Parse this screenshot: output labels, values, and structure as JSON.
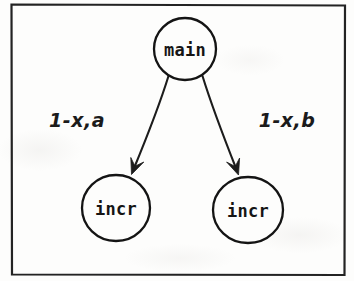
{
  "figure": {
    "type": "node-edge-diagram",
    "frame": {
      "present": true,
      "stroke_color": "#222222"
    },
    "background_color": "#fdfdfc",
    "ink_color": "#151515"
  },
  "nodes": [
    {
      "id": "main",
      "label": "main",
      "role": "root",
      "cx": 185,
      "cy": 49,
      "rx": 31,
      "ry": 31
    },
    {
      "id": "incr-left",
      "label": "incr",
      "role": "leaf",
      "cx": 116,
      "cy": 208,
      "rx": 34,
      "ry": 33
    },
    {
      "id": "incr-right",
      "label": "incr",
      "role": "leaf",
      "cx": 248,
      "cy": 210,
      "rx": 35,
      "ry": 33
    }
  ],
  "edges": [
    {
      "id": "edge-left",
      "from": "main",
      "to": "incr-left",
      "label": "1-x,a",
      "label_x": 77,
      "label_y": 127,
      "arrowhead": true
    },
    {
      "id": "edge-right",
      "from": "main",
      "to": "incr-right",
      "label": "1-x,b",
      "label_x": 287,
      "label_y": 127,
      "arrowhead": true
    }
  ]
}
